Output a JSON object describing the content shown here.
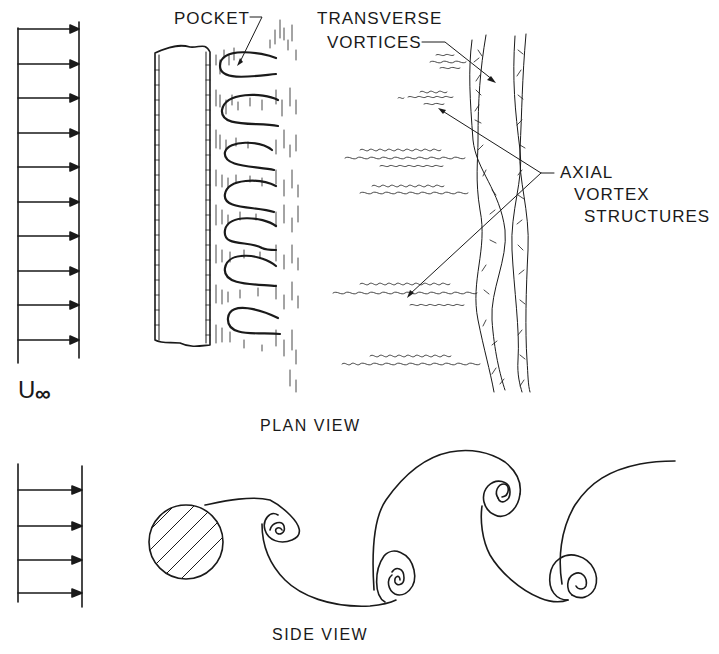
{
  "diagram": {
    "colors": {
      "ink": "#1a1a1a",
      "background": "#ffffff"
    },
    "plan_view": {
      "caption": "PLAN VIEW",
      "freestream_label_main": "U",
      "freestream_label_sub": "∞",
      "freestream_arrow_count": 10,
      "labels": {
        "pocket": "POCKET",
        "transverse_line1": "TRANSVERSE",
        "transverse_line2": "VORTICES",
        "axial_line1": "AXIAL",
        "axial_line2": "VORTEX",
        "axial_line3": "STRUCTURES"
      },
      "pocket_count": 7,
      "streak_count": 5
    },
    "side_view": {
      "caption": "SIDE VIEW",
      "freestream_arrow_count": 4,
      "cylinder": "hatched-circle",
      "vortex_count": 5
    }
  }
}
